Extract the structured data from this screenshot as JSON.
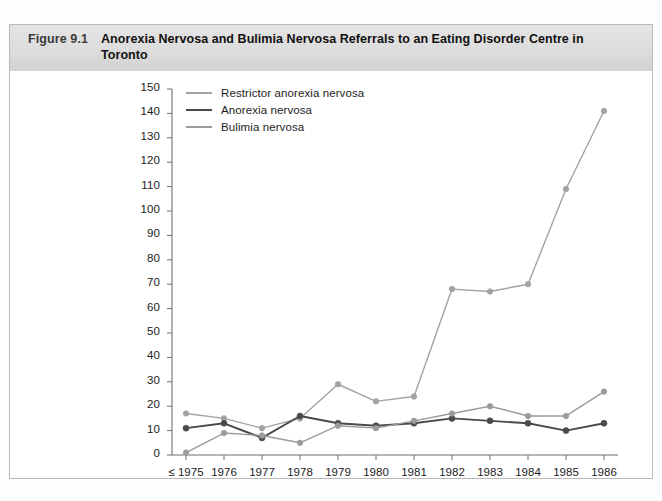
{
  "figure": {
    "number": "Figure 9.1",
    "title": "Anorexia Nervosa and Bulimia Nervosa Referrals to an Eating Disorder Centre in Toronto"
  },
  "chart_data": {
    "type": "line",
    "title": "Anorexia Nervosa and Bulimia Nervosa Referrals to an Eating Disorder Centre in Toronto",
    "xlabel": "",
    "ylabel": "",
    "categories": [
      "≤ 1975",
      "1976",
      "1977",
      "1978",
      "1979",
      "1980",
      "1981",
      "1982",
      "1983",
      "1984",
      "1985",
      "1986"
    ],
    "ylim": [
      0,
      150
    ],
    "ytick_step": 10,
    "yticks": [
      0,
      10,
      20,
      30,
      40,
      50,
      60,
      70,
      80,
      90,
      100,
      110,
      120,
      130,
      140,
      150
    ],
    "grid": false,
    "legend_position": "top-left-inside",
    "markers": true,
    "series": [
      {
        "name": "Restrictor anorexia nervosa",
        "color": "#a3a3a3",
        "values": [
          17,
          15,
          11,
          15,
          29,
          22,
          24,
          68,
          67,
          70,
          109,
          141
        ]
      },
      {
        "name": "Anorexia nervosa",
        "color": "#4a4a4a",
        "values": [
          11,
          13,
          7,
          16,
          13,
          12,
          13,
          15,
          14,
          13,
          10,
          13
        ]
      },
      {
        "name": "Bulimia nervosa",
        "color": "#9b9b9b",
        "values": [
          1,
          9,
          8,
          5,
          12,
          11,
          14,
          17,
          20,
          16,
          16,
          26
        ]
      }
    ]
  },
  "axis": {
    "y_labels": [
      "150",
      "140",
      "130",
      "120",
      "110",
      "100",
      "90",
      "80",
      "70",
      "60",
      "50",
      "40",
      "30",
      "20",
      "10",
      "0"
    ],
    "x_labels": [
      "≤ 1975",
      "1976",
      "1977",
      "1978",
      "1979",
      "1980",
      "1981",
      "1982",
      "1983",
      "1984",
      "1985",
      "1986"
    ]
  },
  "legend": {
    "items": [
      {
        "label": "Restrictor anorexia nervosa",
        "color": "#a3a3a3"
      },
      {
        "label": "Anorexia nervosa",
        "color": "#4a4a4a"
      },
      {
        "label": "Bulimia nervosa",
        "color": "#9b9b9b"
      }
    ]
  }
}
